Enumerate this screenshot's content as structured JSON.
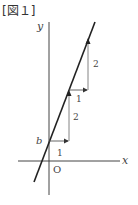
{
  "figure": {
    "title": "[図１]"
  },
  "axes": {
    "x_label": "x",
    "y_label": "y",
    "origin_label": "O",
    "intercept_label": "b"
  },
  "steps": [
    {
      "run_label": "1",
      "rise_label": "2"
    },
    {
      "run_label": "1",
      "rise_label": "2"
    }
  ],
  "colors": {
    "line": "#222222",
    "axis": "#444444",
    "guide": "#666666",
    "text": "#444444"
  }
}
